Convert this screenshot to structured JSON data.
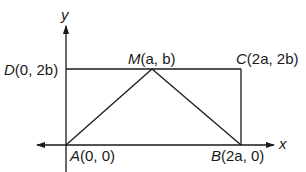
{
  "diagram": {
    "type": "coordinate-geometry",
    "axes": {
      "x_label": "x",
      "y_label": "y"
    },
    "points": {
      "A": {
        "name": "A",
        "coords": "(0, 0)"
      },
      "B": {
        "name": "B",
        "coords": "(2a, 0)"
      },
      "C": {
        "name": "C",
        "coords": "(2a, 2b)"
      },
      "D": {
        "name": "D",
        "coords": "(0, 2b)"
      },
      "M": {
        "name": "M",
        "coords": "(a, b)"
      }
    },
    "segments": [
      "A-M",
      "M-B",
      "D-C",
      "C-B",
      "A-B",
      "A-D"
    ],
    "colors": {
      "ink": "#1a1a1a",
      "background": "#ffffff"
    }
  }
}
